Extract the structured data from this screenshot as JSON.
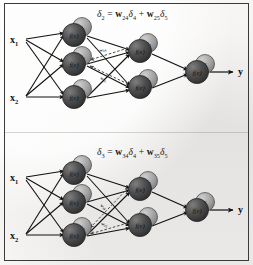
{
  "figure": {
    "type": "neural-network-backpropagation-diagram",
    "background_color": "#f4f3f1",
    "border_color": "#3a3a3a",
    "node_fill_color": "#4a4a4a",
    "badge_fill_color": "#a0a0a0",
    "arrow_color": "#111111",
    "backprop_arrow_color": "#555555"
  },
  "panels": [
    {
      "id": "panel-top",
      "equation": {
        "lhs_symbol": "δ",
        "lhs_sub": "2",
        "equals": "=",
        "term1_w": "w",
        "term1_w_sub": "24",
        "term1_d": "δ",
        "term1_d_sub": "4",
        "plus": "+",
        "term2_w": "w",
        "term2_w_sub": "25",
        "term2_d": "δ",
        "term2_d_sub": "5",
        "plain": "δ₂ = w₂₄δ₄ + w₂₅δ₅"
      },
      "inputs": [
        {
          "label": "x",
          "sub": "1"
        },
        {
          "label": "x",
          "sub": "2"
        }
      ],
      "output": {
        "label": "y"
      },
      "hidden_layer_1": [
        {
          "fn": "f(e)",
          "delta": "δ",
          "delta_sub": "1"
        },
        {
          "fn": "f(e)",
          "delta": "δ",
          "delta_sub": "2"
        },
        {
          "fn": "f(e)",
          "delta": "δ",
          "delta_sub": "3"
        }
      ],
      "hidden_layer_2": [
        {
          "fn": "f(e)",
          "delta": "δ",
          "delta_sub": "4"
        },
        {
          "fn": "f(e)",
          "delta": "δ",
          "delta_sub": "5"
        }
      ],
      "output_layer": [
        {
          "fn": "f(e)",
          "delta": "δ",
          "delta_sub": ""
        }
      ],
      "backprop_weights": [
        {
          "w": "w",
          "sub": "24"
        },
        {
          "w": "w",
          "sub": "25"
        }
      ],
      "highlighted_node_index": 1
    },
    {
      "id": "panel-bottom",
      "equation": {
        "lhs_symbol": "δ",
        "lhs_sub": "3",
        "equals": "=",
        "term1_w": "w",
        "term1_w_sub": "34",
        "term1_d": "δ",
        "term1_d_sub": "4",
        "plus": "+",
        "term2_w": "w",
        "term2_w_sub": "35",
        "term2_d": "δ",
        "term2_d_sub": "5",
        "plain": "δ₃ = w₃₄δ₄ + w₃₅δ₅"
      },
      "inputs": [
        {
          "label": "x",
          "sub": "1"
        },
        {
          "label": "x",
          "sub": "2"
        }
      ],
      "output": {
        "label": "y"
      },
      "hidden_layer_1": [
        {
          "fn": "f(e)",
          "delta": "δ",
          "delta_sub": "1"
        },
        {
          "fn": "f(e)",
          "delta": "δ",
          "delta_sub": "2"
        },
        {
          "fn": "f(e)",
          "delta": "δ",
          "delta_sub": "3"
        }
      ],
      "hidden_layer_2": [
        {
          "fn": "f(e)",
          "delta": "δ",
          "delta_sub": "4"
        },
        {
          "fn": "f(e)",
          "delta": "δ",
          "delta_sub": "5"
        }
      ],
      "output_layer": [
        {
          "fn": "f(e)",
          "delta": "δ",
          "delta_sub": ""
        }
      ],
      "backprop_weights": [
        {
          "w": "w",
          "sub": "34"
        },
        {
          "w": "w",
          "sub": "35"
        }
      ],
      "highlighted_node_index": 2
    }
  ]
}
